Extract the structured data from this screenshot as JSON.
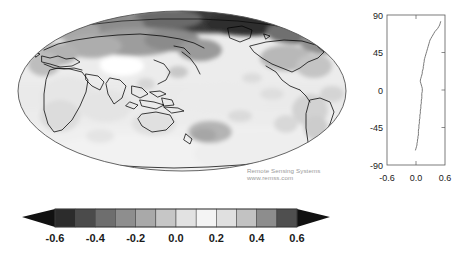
{
  "figure": {
    "title": "",
    "background": "#ffffff",
    "credit_lines": [
      "Remote Sensing Systems",
      "www.remss.com"
    ],
    "credit_color": "#9a9a9a"
  },
  "map": {
    "projection": "mollweide",
    "center_longitude": 100,
    "coastline_color": "#000000",
    "outline_color": "#555555",
    "land_fill": "none",
    "description": "global grayscale anomaly map"
  },
  "chart_data": [
    {
      "type": "heatmap",
      "name": "global-anomaly-map",
      "title": "",
      "projection": "mollweide",
      "xlabel": "",
      "ylabel": "",
      "colorbar": {
        "ticks": [
          "-0.6",
          "-0.4",
          "-0.2",
          "0.0",
          "0.2",
          "0.4",
          "0.6"
        ],
        "tick_values": [
          -0.6,
          -0.4,
          -0.2,
          0.0,
          0.2,
          0.4,
          0.6
        ],
        "vmin": -0.6,
        "vmax": 0.6,
        "extend": "both",
        "orientation": "horizontal",
        "n_levels": 12,
        "level_edges": [
          -0.6,
          -0.5,
          -0.4,
          -0.3,
          -0.2,
          -0.1,
          0.0,
          0.1,
          0.2,
          0.3,
          0.4,
          0.5,
          0.6
        ],
        "colors": [
          "#2c2c2c",
          "#4b4b4b",
          "#6e6e6e",
          "#8e8e8e",
          "#a9a9a9",
          "#c6c6c6",
          "#e2e2e2",
          "#f4f4f4",
          "#e0e0e0",
          "#c2c2c2",
          "#8d8d8d",
          "#4f4f4f",
          "#262626"
        ],
        "under_color": "#111111",
        "over_color": "#111111"
      }
    },
    {
      "type": "line",
      "name": "zonal-mean-profile",
      "title": "",
      "xlabel": "",
      "ylabel": "",
      "orientation": "value-vs-latitude",
      "xlim": [
        -0.6,
        0.6
      ],
      "ylim": [
        -90,
        90
      ],
      "xticks": [
        -0.6,
        0.0,
        0.6
      ],
      "xticklabels": [
        "-0.6",
        "0.0",
        "0.6"
      ],
      "yticks": [
        90,
        45,
        0,
        -45,
        -90
      ],
      "yticklabels": [
        "90",
        "45",
        "0",
        "-45",
        "-90"
      ],
      "grid": false,
      "legend": null,
      "line_color": "#6b6b6b",
      "series": [
        {
          "name": "zonal mean anomaly",
          "latitude": [
            -72,
            -70,
            -68,
            -66,
            -64,
            -62,
            -60,
            -58,
            -56,
            -54,
            -52,
            -50,
            -48,
            -46,
            -44,
            -42,
            -40,
            -38,
            -36,
            -34,
            -32,
            -30,
            -28,
            -26,
            -24,
            -22,
            -20,
            -18,
            -16,
            -14,
            -12,
            -10,
            -8,
            -6,
            -4,
            -2,
            0,
            2,
            4,
            6,
            8,
            10,
            12,
            14,
            16,
            18,
            20,
            22,
            24,
            26,
            28,
            30,
            32,
            34,
            36,
            38,
            40,
            42,
            44,
            46,
            48,
            50,
            52,
            54,
            56,
            58,
            60,
            62,
            64,
            66,
            68,
            70,
            72,
            74,
            76,
            78,
            80,
            82
          ],
          "values": [
            -0.01,
            0.0,
            0.01,
            0.02,
            0.02,
            0.03,
            0.03,
            0.04,
            0.04,
            0.05,
            0.05,
            0.05,
            0.05,
            0.06,
            0.06,
            0.06,
            0.07,
            0.07,
            0.07,
            0.08,
            0.08,
            0.08,
            0.09,
            0.09,
            0.09,
            0.1,
            0.1,
            0.1,
            0.11,
            0.11,
            0.11,
            0.12,
            0.12,
            0.12,
            0.12,
            0.13,
            0.13,
            0.13,
            0.12,
            0.11,
            0.1,
            0.09,
            0.09,
            0.1,
            0.11,
            0.12,
            0.13,
            0.13,
            0.14,
            0.15,
            0.15,
            0.16,
            0.16,
            0.17,
            0.17,
            0.18,
            0.19,
            0.2,
            0.21,
            0.22,
            0.23,
            0.24,
            0.25,
            0.26,
            0.27,
            0.28,
            0.29,
            0.31,
            0.33,
            0.35,
            0.37,
            0.39,
            0.42,
            0.45,
            0.47,
            0.49,
            0.5,
            0.51
          ]
        }
      ]
    }
  ]
}
